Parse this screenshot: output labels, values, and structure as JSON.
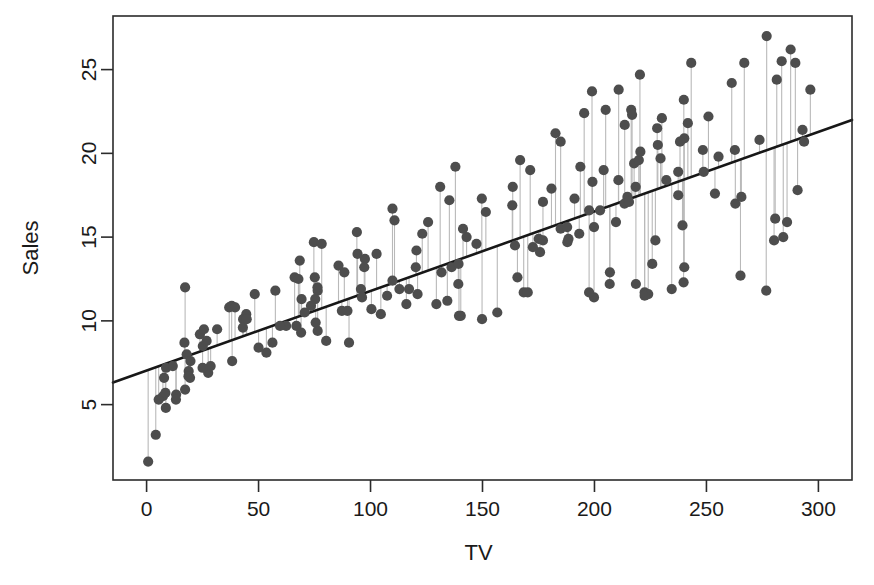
{
  "chart_data": {
    "type": "scatter",
    "title": "",
    "xlabel": "TV",
    "ylabel": "Sales",
    "xlim": [
      -15,
      315
    ],
    "ylim": [
      0.5,
      28.2
    ],
    "grid": false,
    "legend": "none",
    "xticks": [
      0,
      50,
      100,
      150,
      200,
      250,
      300
    ],
    "xtick_labels": [
      "0",
      "50",
      "100",
      "150",
      "200",
      "250",
      "300"
    ],
    "yticks": [
      5,
      10,
      15,
      20,
      25
    ],
    "ytick_labels": [
      "5",
      "10",
      "15",
      "20",
      "25"
    ],
    "point_color": "#4d4d4d",
    "residual_color": "#b9b9b9",
    "fit_color": "#171717",
    "axis_color": "#2b2b2b",
    "background_color": "#ffffff",
    "fit_line": {
      "name": "least-squares regression",
      "intercept": 7.0326,
      "slope": 0.0475,
      "x_start": -15,
      "x_end": 315
    },
    "series": [
      {
        "name": "Advertising: TV vs Sales",
        "x": [
          230.1,
          44.5,
          17.2,
          151.5,
          180.8,
          8.7,
          57.5,
          120.2,
          8.6,
          199.8,
          66.1,
          214.7,
          23.8,
          97.5,
          204.1,
          195.4,
          67.8,
          281.4,
          69.2,
          147.3,
          218.4,
          237.4,
          13.2,
          228.3,
          62.3,
          262.9,
          142.9,
          240.1,
          248.8,
          70.6,
          292.9,
          112.9,
          97.2,
          265.6,
          95.7,
          290.7,
          266.9,
          74.7,
          43.1,
          228.0,
          202.5,
          177.0,
          293.6,
          206.9,
          25.1,
          175.1,
          89.7,
          239.9,
          227.2,
          66.9,
          199.8,
          100.4,
          216.4,
          182.6,
          262.7,
          198.9,
          7.3,
          136.2,
          210.8,
          210.7,
          53.5,
          261.3,
          239.3,
          102.7,
          131.1,
          69.0,
          31.5,
          139.3,
          237.4,
          216.8,
          199.1,
          109.8,
          26.8,
          129.4,
          213.4,
          16.9,
          27.5,
          120.5,
          5.4,
          116.0,
          76.4,
          239.8,
          75.3,
          68.4,
          213.5,
          193.2,
          76.3,
          110.7,
          88.3,
          109.8,
          134.3,
          28.6,
          217.7,
          250.9,
          107.4,
          163.3,
          197.6,
          184.9,
          289.7,
          135.2,
          222.4,
          296.4,
          280.2,
          187.9,
          238.2,
          137.9,
          25.0,
          90.4,
          13.1,
          255.4,
          225.8,
          241.7,
          175.7,
          209.6,
          78.2,
          75.1,
          139.2,
          76.4,
          125.7,
          19.4,
          141.3,
          18.8,
          224.0,
          123.1,
          229.5,
          87.2,
          7.8,
          80.2,
          220.3,
          59.6,
          0.7,
          265.2,
          8.4,
          219.8,
          36.9,
          48.3,
          25.6,
          273.7,
          43.0,
          184.9,
          73.4,
          193.7,
          220.5,
          104.6,
          96.2,
          140.3,
          240.1,
          243.2,
          38.0,
          44.7,
          280.7,
          121.0,
          197.6,
          171.3,
          187.8,
          4.1,
          93.9,
          149.8,
          11.7,
          131.7,
          172.5,
          85.7,
          188.4,
          163.5,
          117.2,
          234.5,
          17.9,
          206.8,
          215.4,
          284.3,
          50.0,
          164.5,
          19.6,
          168.4,
          222.4,
          276.9,
          248.4,
          170.2,
          276.7,
          165.6,
          156.6,
          218.5,
          56.2,
          287.6,
          253.8,
          205.0,
          139.5,
          191.1,
          286.0,
          18.7,
          39.5,
          75.5,
          17.2,
          166.8,
          149.7,
          38.2,
          94.2,
          177.0,
          283.6,
          232.1
        ],
        "y": [
          22.1,
          10.4,
          12.0,
          16.5,
          17.9,
          7.2,
          11.8,
          13.2,
          4.8,
          15.6,
          12.6,
          17.4,
          9.2,
          13.7,
          19.0,
          22.4,
          12.5,
          24.4,
          11.3,
          14.6,
          18.0,
          17.5,
          5.6,
          20.5,
          9.7,
          17.0,
          15.0,
          20.9,
          18.9,
          10.5,
          21.4,
          11.9,
          13.2,
          17.4,
          11.9,
          17.8,
          25.4,
          14.7,
          10.1,
          21.5,
          16.6,
          17.1,
          20.7,
          12.9,
          8.5,
          14.9,
          10.6,
          23.2,
          14.8,
          9.7,
          11.4,
          10.7,
          22.6,
          21.2,
          20.2,
          23.7,
          5.5,
          13.2,
          23.8,
          18.4,
          8.1,
          24.2,
          15.7,
          14.0,
          18.0,
          9.3,
          9.5,
          13.4,
          18.9,
          22.3,
          18.3,
          12.4,
          8.8,
          11.0,
          17.0,
          8.7,
          6.9,
          14.2,
          5.3,
          11.0,
          11.8,
          12.3,
          11.3,
          13.6,
          21.7,
          15.2,
          12.0,
          16.0,
          12.9,
          16.7,
          11.2,
          7.3,
          19.4,
          22.2,
          11.5,
          16.9,
          11.7,
          15.5,
          25.4,
          17.2,
          11.7,
          23.8,
          14.8,
          14.7,
          20.7,
          19.2,
          7.2,
          8.7,
          5.3,
          19.8,
          13.4,
          21.8,
          14.1,
          15.9,
          14.6,
          12.6,
          12.2,
          9.4,
          15.9,
          6.6,
          15.5,
          7.0,
          11.6,
          15.2,
          19.7,
          10.6,
          6.6,
          8.8,
          24.7,
          9.7,
          1.6,
          12.7,
          5.7,
          19.6,
          10.8,
          11.6,
          9.5,
          20.8,
          9.6,
          20.7,
          10.9,
          19.2,
          20.1,
          10.4,
          11.4,
          10.3,
          13.2,
          25.4,
          10.9,
          10.1,
          16.1,
          11.6,
          16.6,
          19.0,
          15.6,
          3.2,
          15.3,
          10.1,
          7.3,
          12.9,
          14.4,
          13.3,
          14.9,
          18.0,
          11.9,
          11.9,
          8.0,
          12.2,
          17.1,
          15.0,
          8.4,
          14.5,
          7.6,
          11.7,
          11.5,
          27.0,
          20.2,
          11.7,
          11.8,
          12.6,
          10.5,
          12.2,
          8.7,
          26.2,
          17.6,
          22.6,
          10.3,
          17.3,
          15.9,
          6.7,
          10.8,
          9.9,
          5.9,
          19.6,
          17.3,
          7.6,
          14.0,
          14.8,
          25.5,
          18.4
        ]
      }
    ]
  }
}
